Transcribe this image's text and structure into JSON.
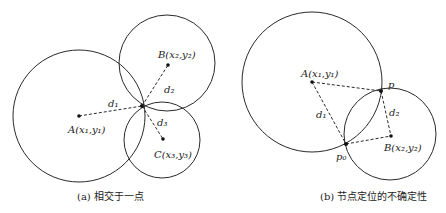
{
  "figure": {
    "panel_a": {
      "caption": "(a) 相交于一点",
      "nodes": {
        "A": {
          "label": "A(x₁,y₁)"
        },
        "B": {
          "label": "B(x₂,y₂)"
        },
        "C": {
          "label": "C(x₃,y₃)"
        }
      },
      "distances": {
        "d1": "d₁",
        "d2": "d₂",
        "d3": "d₃"
      }
    },
    "panel_b": {
      "caption": "(b) 节点定位的不确定性",
      "nodes": {
        "A": {
          "label": "A(x₁,y₁)"
        },
        "B": {
          "label": "B(x₂,y₂)"
        },
        "p": {
          "label": "p"
        },
        "p0": {
          "label": "p₀"
        }
      },
      "distances": {
        "d1": "d₁",
        "d2": "d₂"
      }
    }
  }
}
